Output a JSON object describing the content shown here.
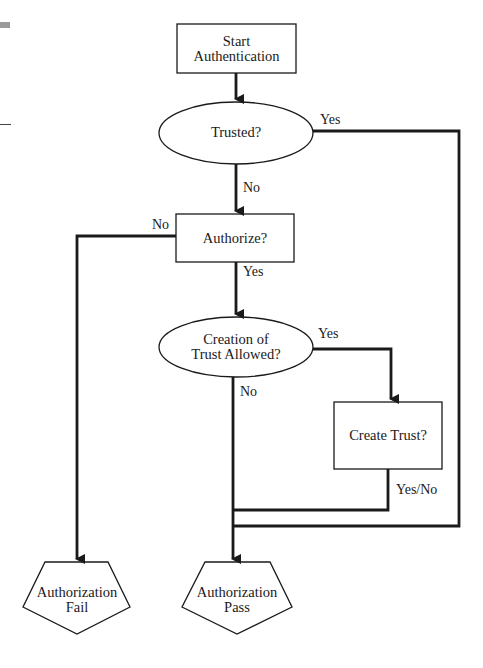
{
  "diagram": {
    "type": "flowchart",
    "nodes": {
      "start": {
        "line1": "Start",
        "line2": "Authentication",
        "shape": "rectangle"
      },
      "trusted": {
        "label": "Trusted?",
        "shape": "ellipse"
      },
      "authorize": {
        "label": "Authorize?",
        "shape": "rectangle"
      },
      "creation": {
        "line1": "Creation of",
        "line2": "Trust Allowed?",
        "shape": "ellipse"
      },
      "create_trust": {
        "label": "Create Trust?",
        "shape": "rectangle"
      },
      "fail": {
        "line1": "Authorization",
        "line2": "Fail",
        "shape": "pentagon"
      },
      "pass": {
        "line1": "Authorization",
        "line2": "Pass",
        "shape": "pentagon"
      }
    },
    "edges": {
      "trusted_yes": "Yes",
      "trusted_no": "No",
      "authorize_no": "No",
      "authorize_yes": "Yes",
      "creation_yes": "Yes",
      "creation_no": "No",
      "create_trust_out": "Yes/No"
    },
    "colors": {
      "stroke": "#1a1a1a",
      "background": "#ffffff"
    }
  }
}
